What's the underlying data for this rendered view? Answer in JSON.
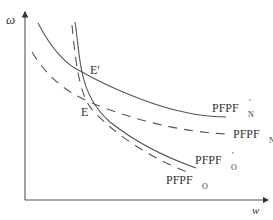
{
  "axes": {
    "y_label": "ω",
    "x_label": "w"
  },
  "points": {
    "E_prime": "E′",
    "E": "E"
  },
  "curves": {
    "pfpf_n_prime": {
      "base": "PFPF",
      "sub": "N",
      "sup": "′",
      "style": "solid"
    },
    "pfpf_n": {
      "base": "PFPF",
      "sub": "N",
      "sup": "",
      "style": "dashed"
    },
    "pfpf_o_prime": {
      "base": "PFPF",
      "sub": "O",
      "sup": "′",
      "style": "solid"
    },
    "pfpf_o": {
      "base": "PFPF",
      "sub": "O",
      "sup": "",
      "style": "dashed"
    }
  },
  "colors": {
    "line": "#555555",
    "text": "#333333",
    "background": "#ffffff"
  }
}
